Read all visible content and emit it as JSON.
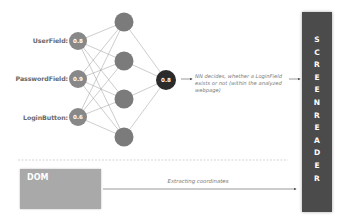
{
  "inputs": [
    {
      "label": "UserField:",
      "value": "0.8"
    },
    {
      "label": "PasswordField:",
      "value": "0.9"
    },
    {
      "label": "LoginButton:",
      "value": "0.6"
    }
  ],
  "hidden_layer_count": 4,
  "output": {
    "value": "0.8"
  },
  "nn_decision_text": "NN decides, whether a LoginField exists or not (within the analyzed webpage)",
  "dom": {
    "label": "DOM"
  },
  "extract": {
    "label": "Extracting coordinates"
  },
  "screen_reader": {
    "label": "SCREENREADER",
    "letters": [
      "S",
      "C",
      "R",
      "E",
      "E",
      "N",
      "R",
      "E",
      "A",
      "D",
      "E",
      "R"
    ]
  },
  "colors": {
    "input_node": "#888888",
    "hidden_node": "#7b7b7b",
    "output_node": "#2b2b2b",
    "screen_reader_bg": "#4b4b4b",
    "dom_bg": "#a9a9a9",
    "edge": "#9a9a9a"
  }
}
